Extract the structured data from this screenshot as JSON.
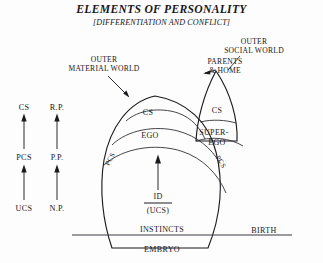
{
  "title": {
    "main": "ELEMENTS OF PERSONALITY",
    "subtitle": "[DIFFERENTIATION AND CONFLICT]"
  },
  "callouts": {
    "outer_material_world": {
      "line1": "OUTER",
      "line2": "MATERIAL WORLD"
    },
    "outer_social_world": {
      "line1": "OUTER",
      "line2": "SOCIAL WORLD"
    },
    "parents_home": {
      "line1": "PARENTS",
      "line2": "& HOME"
    }
  },
  "axis_left": {
    "column_one": {
      "top": "CS",
      "middle": "PCS",
      "bottom": "UCS"
    },
    "column_two": {
      "top": "R.P.",
      "middle": "P.P.",
      "bottom": "N.P."
    }
  },
  "diagram": {
    "ego_dome": {
      "cs": "CS",
      "ego": "EGO",
      "pcs_left": "PCS",
      "pcs_right": "PCS"
    },
    "superego_lobe": {
      "cs": "CS",
      "superego_line1": "SUPER-",
      "superego_line2": "EGO"
    },
    "id_core": {
      "label": "ID",
      "sublabel": "(UCS)"
    },
    "baseline": {
      "instincts": "INSTINCTS",
      "birth": "BIRTH",
      "embryo": "EMBRYO"
    }
  },
  "colors": {
    "ink": "#17171a",
    "rule": "#3a3a42",
    "background": "#fdfdfd"
  }
}
